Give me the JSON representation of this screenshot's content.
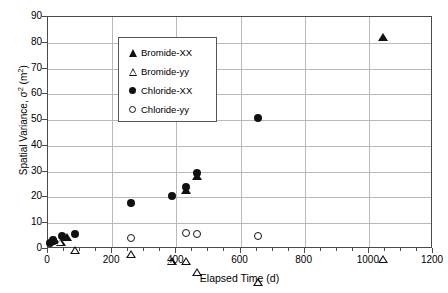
{
  "chart_data": {
    "type": "scatter",
    "title": "",
    "xlabel": "Elapsed Time  (d)",
    "ylabel": "Spatial Variance, σ² (m²)",
    "ylabel_parts": {
      "prefix": "Spatial Variance, ",
      "sigma": "σ",
      "exp": "2",
      "unit_open": " (m",
      "unit_exp": "2",
      "unit_close": ")"
    },
    "xlim": [
      0,
      1200
    ],
    "ylim": [
      0,
      90
    ],
    "xticks": [
      0,
      200,
      400,
      600,
      800,
      1000,
      1200
    ],
    "yticks": [
      0,
      10,
      20,
      30,
      40,
      50,
      60,
      70,
      80,
      90
    ],
    "x_minor_interval": 50,
    "grid": "both",
    "grid_color": "#b9b9b9",
    "frame_color": "#4a4a4a",
    "marker_color": "#111111",
    "legend_position": "top-left",
    "series": [
      {
        "name": "Bromide-XX",
        "marker": "triangle-filled",
        "points": [
          {
            "x": 10,
            "y": 3.0
          },
          {
            "x": 22,
            "y": 3.6
          },
          {
            "x": 58,
            "y": 4.6
          },
          {
            "x": 430,
            "y": 23.0
          },
          {
            "x": 465,
            "y": 28.4
          },
          {
            "x": 1045,
            "y": 82.2
          }
        ]
      },
      {
        "name": "Bromide-yy",
        "marker": "triangle-open",
        "points": [
          {
            "x": 40,
            "y": 2.6
          },
          {
            "x": 85,
            "y": 2.6
          },
          {
            "x": 260,
            "y": 4.4
          },
          {
            "x": 385,
            "y": 4.8
          },
          {
            "x": 430,
            "y": 7.8
          },
          {
            "x": 465,
            "y": 6.6
          },
          {
            "x": 655,
            "y": 6.0
          },
          {
            "x": 1045,
            "y": 18.0
          }
        ]
      },
      {
        "name": "Chloride-XX",
        "marker": "circle-filled",
        "points": [
          {
            "x": 6,
            "y": 2.5
          },
          {
            "x": 16,
            "y": 3.4
          },
          {
            "x": 45,
            "y": 5.0
          },
          {
            "x": 85,
            "y": 5.7
          },
          {
            "x": 260,
            "y": 18.0
          },
          {
            "x": 385,
            "y": 20.7
          },
          {
            "x": 430,
            "y": 24.0
          },
          {
            "x": 465,
            "y": 29.6
          },
          {
            "x": 655,
            "y": 50.7
          }
        ]
      },
      {
        "name": "Chloride-yy",
        "marker": "circle-open",
        "points": [
          {
            "x": 260,
            "y": 4.2
          },
          {
            "x": 430,
            "y": 6.3
          },
          {
            "x": 465,
            "y": 5.7
          },
          {
            "x": 655,
            "y": 5.2
          }
        ]
      }
    ]
  }
}
